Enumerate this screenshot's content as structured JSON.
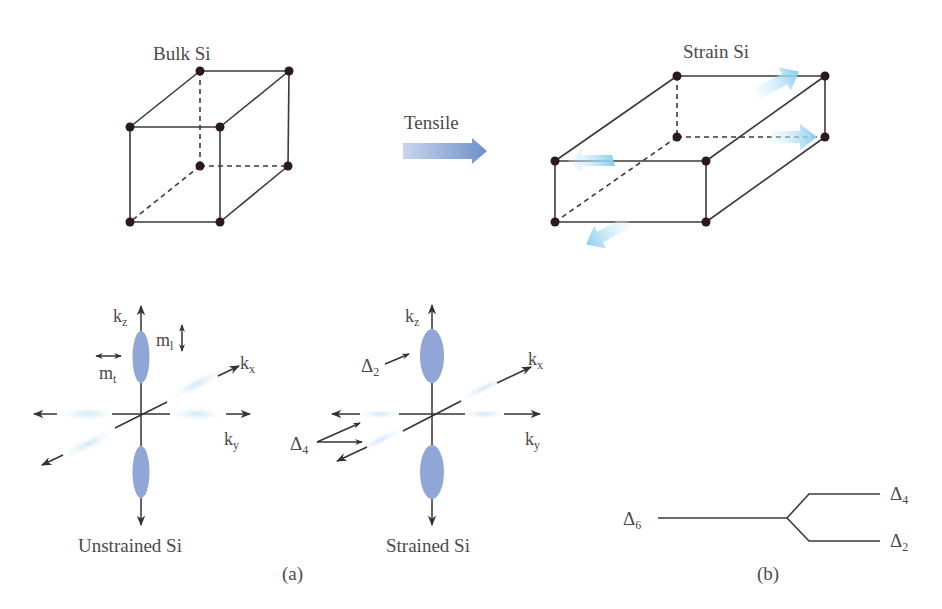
{
  "figure": {
    "top": {
      "bulk": {
        "title": "Bulk Si"
      },
      "strained": {
        "title": "Strain Si"
      },
      "arrow": {
        "label": "Tensile"
      }
    },
    "panel_a": {
      "caption": "(a)",
      "unstrained": {
        "caption": "Unstrained Si",
        "kz": "k",
        "kz_sub": "z",
        "kx": "k",
        "kx_sub": "x",
        "ky": "k",
        "ky_sub": "y",
        "ml": "m",
        "ml_sub": "l",
        "mt": "m",
        "mt_sub": "t"
      },
      "strained": {
        "caption": "Strained Si",
        "kz": "k",
        "kz_sub": "z",
        "kx": "k",
        "kx_sub": "x",
        "ky": "k",
        "ky_sub": "y",
        "delta2": "Δ",
        "delta2_sub": "2",
        "delta4": "Δ",
        "delta4_sub": "4"
      }
    },
    "panel_b": {
      "caption": "(b)",
      "delta6": "Δ",
      "delta6_sub": "6",
      "delta4": "Δ",
      "delta4_sub": "4",
      "delta2": "Δ",
      "delta2_sub": "2"
    },
    "colors": {
      "line": "#3a3a3a",
      "vertex": "#2a1a1a",
      "valley": "#8fa6d6",
      "strain_arrow": "#8fd0f0",
      "tensile_arrow": "#7f9fd0"
    }
  }
}
